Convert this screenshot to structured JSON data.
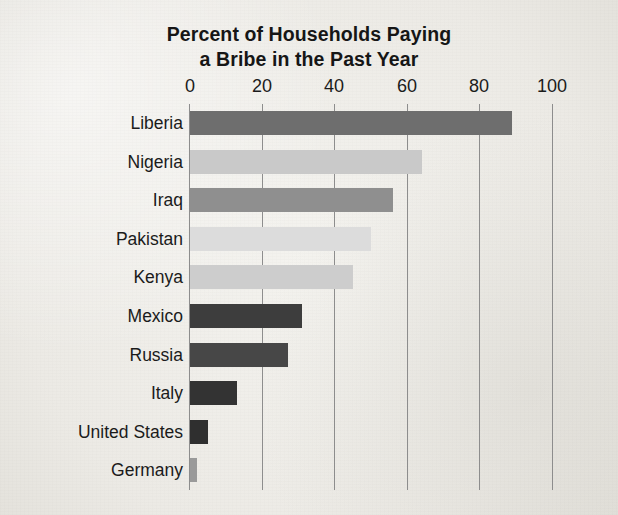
{
  "chart_data": {
    "type": "bar",
    "orientation": "horizontal",
    "title": "Percent of Households Paying a Bribe in the Past Year",
    "title_lines": [
      "Percent of Households Paying",
      "a Bribe in the Past Year"
    ],
    "xlabel": "",
    "ylabel": "",
    "xlim": [
      0,
      100
    ],
    "xticks": [
      0,
      20,
      40,
      60,
      80,
      100
    ],
    "xtick_labels": [
      "0",
      "20",
      "40",
      "60",
      "80",
      "100"
    ],
    "grid": "vertical gridlines at each x tick",
    "legend": "none",
    "categories": [
      "Liberia",
      "Nigeria",
      "Iraq",
      "Pakistan",
      "Kenya",
      "Mexico",
      "Russia",
      "Italy",
      "United States",
      "Germany"
    ],
    "values": [
      89,
      64,
      56,
      50,
      45,
      31,
      27,
      13,
      5,
      2
    ],
    "bars": [
      {
        "label": "Liberia",
        "value": 89,
        "color": "#6e6e6e"
      },
      {
        "label": "Nigeria",
        "value": 64,
        "color": "#c9c9c9"
      },
      {
        "label": "Iraq",
        "value": 56,
        "color": "#8f8f8f"
      },
      {
        "label": "Pakistan",
        "value": 50,
        "color": "#dcdcdc"
      },
      {
        "label": "Kenya",
        "value": 45,
        "color": "#cdcdcd"
      },
      {
        "label": "Mexico",
        "value": 31,
        "color": "#3d3d3d"
      },
      {
        "label": "Russia",
        "value": 27,
        "color": "#474747"
      },
      {
        "label": "Italy",
        "value": 13,
        "color": "#333333"
      },
      {
        "label": "United States",
        "value": 5,
        "color": "#2f2f2f"
      },
      {
        "label": "Germany",
        "value": 2,
        "color": "#9a9a9a"
      }
    ],
    "colors": {
      "background": "#efeeea",
      "text": "#1b1b1b",
      "gridline": "#8d8d8d"
    }
  }
}
